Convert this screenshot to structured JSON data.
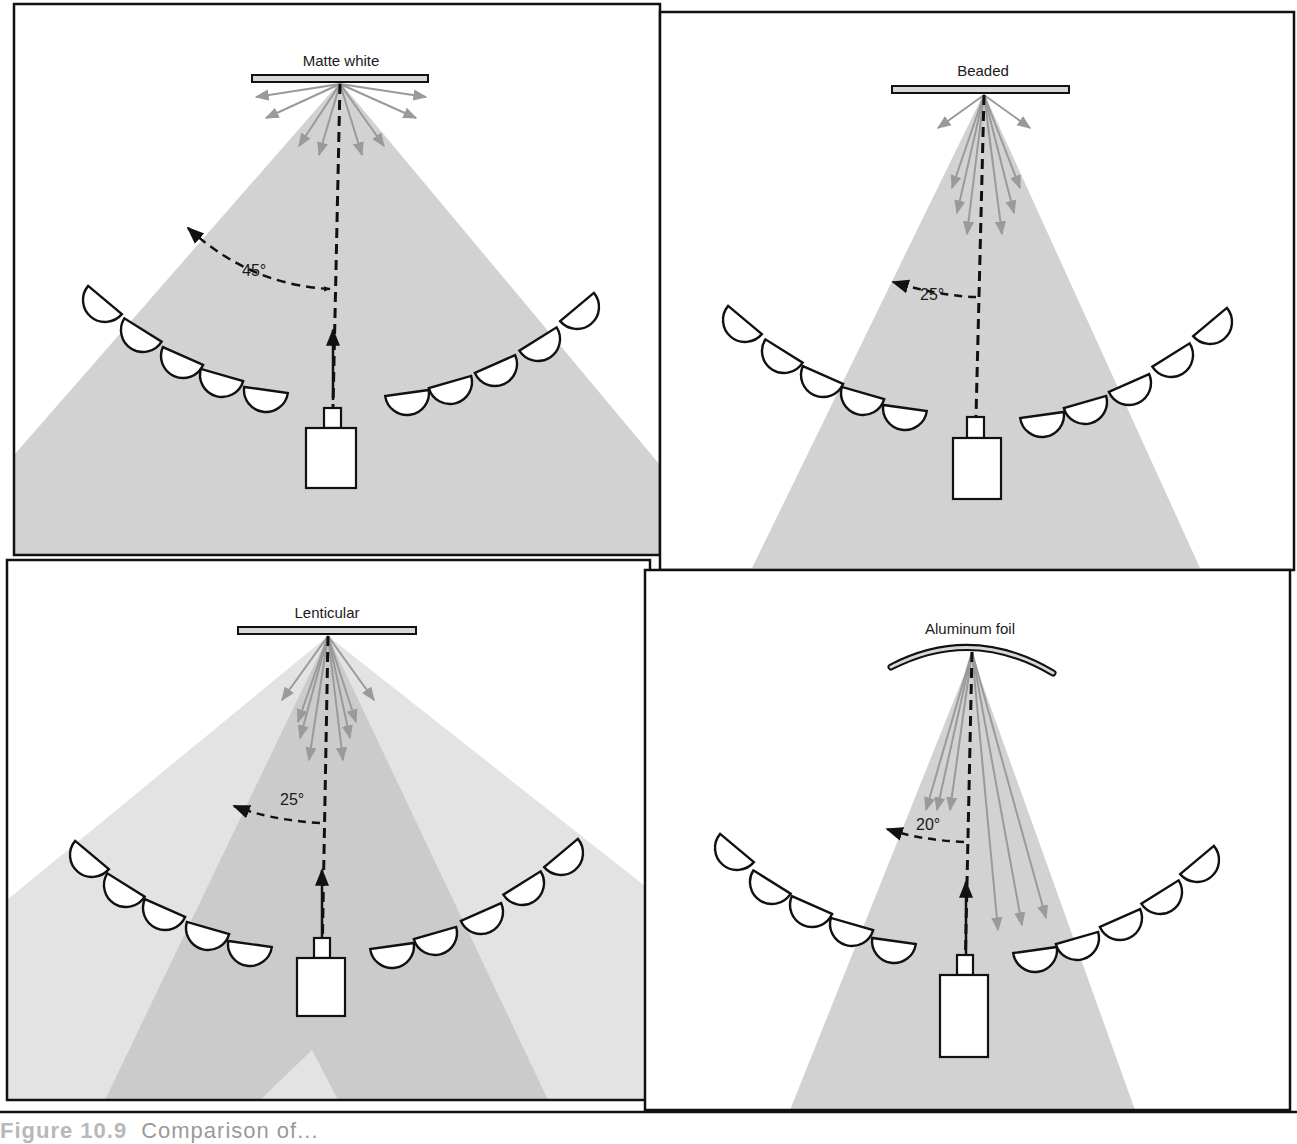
{
  "figure": {
    "caption_number": "Figure 10.9",
    "caption_text": "Comparison of..."
  },
  "colors": {
    "cone_fill": "#d2d2d2",
    "cone_light": "#e2e2e2",
    "cone_dark": "#cbcbcb",
    "ray_color": "#9a9a9a",
    "line_color": "#111111",
    "screen_fill": "#d8d8d8"
  },
  "panels": [
    {
      "id": "matte-white",
      "title": "Matte white",
      "angle_label": "45°",
      "angle_deg": 45
    },
    {
      "id": "beaded",
      "title": "Beaded",
      "angle_label": "25°",
      "angle_deg": 25
    },
    {
      "id": "lenticular",
      "title": "Lenticular",
      "angle_label": "25°",
      "angle_deg": 25
    },
    {
      "id": "aluminum-foil",
      "title": "Aluminum foil",
      "angle_label": "20°",
      "angle_deg": 20
    }
  ]
}
